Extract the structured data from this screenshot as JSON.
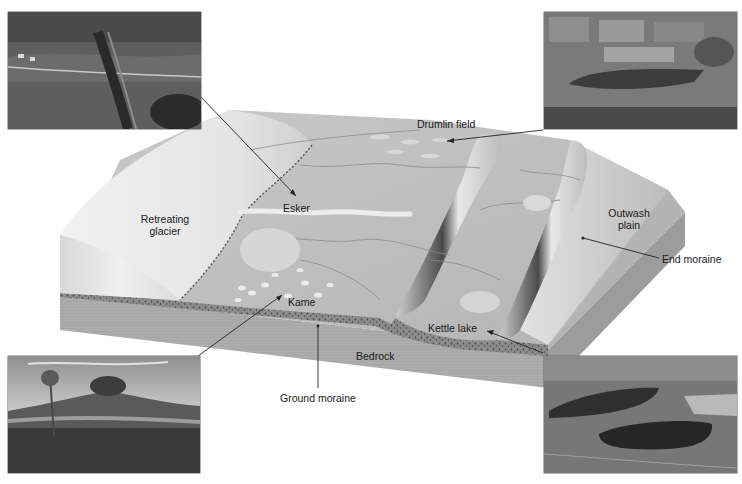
{
  "diagram": {
    "labels": {
      "drumlin_field": "Drumlin field",
      "esker": "Esker",
      "retreating_glacier_line1": "Retreating",
      "retreating_glacier_line2": "glacier",
      "outwash_plain_line1": "Outwash",
      "outwash_plain_line2": "plain",
      "end_moraine": "End moraine",
      "kame": "Kame",
      "kettle_lake": "Kettle lake",
      "bedrock": "Bedrock",
      "ground_moraine": "Ground moraine"
    },
    "photos": [
      {
        "id": "esker-photo",
        "depicts": "Esker",
        "position": "top-left"
      },
      {
        "id": "drumlin-photo",
        "depicts": "Drumlin field",
        "position": "top-right"
      },
      {
        "id": "kame-photo",
        "depicts": "Kame",
        "position": "bottom-left"
      },
      {
        "id": "kettle-lake-photo",
        "depicts": "Kettle lake",
        "position": "bottom-right"
      }
    ],
    "colors": {
      "background": "#ffffff",
      "glacier": "#e6e6e6",
      "plain": "#b9b9b9",
      "moraine_ridge": "#5a5a5a",
      "bedrock": "#a9a9a9",
      "ground_moraine": "#6e6e6e",
      "label_text": "#1a1a1a",
      "leader_line": "#222222"
    }
  }
}
